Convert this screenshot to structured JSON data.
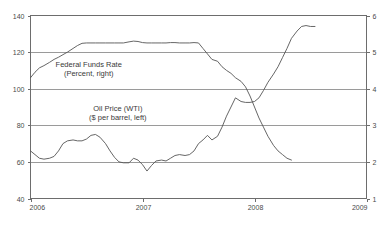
{
  "chart_data": {
    "type": "line",
    "title": "",
    "subtitle": "",
    "xlabel": "",
    "ylabel": "$ per barrel",
    "y2label": "Percent",
    "grid": true,
    "legend_position": "inline-annotation",
    "xlim": [
      2006.0,
      2009.0
    ],
    "xticks": [
      "2006",
      "2007",
      "2008",
      "2009"
    ],
    "xtick_values": [
      2006,
      2007,
      2008,
      2009
    ],
    "ylim": [
      40,
      140
    ],
    "yticks": [
      "40",
      "60",
      "80",
      "100",
      "120",
      "140"
    ],
    "ytick_values": [
      40,
      60,
      80,
      100,
      120,
      140
    ],
    "y2lim": [
      1,
      6
    ],
    "y2ticks": [
      "1",
      "2",
      "3",
      "4",
      "5",
      "6"
    ],
    "y2tick_values": [
      1,
      2,
      3,
      4,
      5,
      6
    ],
    "annotations": [
      {
        "id": "ffr-annotation",
        "line1": "Federal Funds Rate",
        "line2": "(Percent, right)",
        "x": 2006.52,
        "y_axis": "left",
        "y": 112
      },
      {
        "id": "oil-annotation",
        "line1": "Oil Price (WTI)",
        "line2": "($ per barrel, left)",
        "x": 2006.78,
        "y_axis": "left",
        "y": 88
      }
    ],
    "series": [
      {
        "name": "Oil Price (WTI)",
        "axis": "left",
        "units": "$ per barrel",
        "color": "#555555",
        "x": [
          2006.0,
          2006.04,
          2006.08,
          2006.12,
          2006.17,
          2006.21,
          2006.25,
          2006.29,
          2006.33,
          2006.38,
          2006.42,
          2006.46,
          2006.5,
          2006.54,
          2006.58,
          2006.62,
          2006.67,
          2006.71,
          2006.75,
          2006.79,
          2006.83,
          2006.88,
          2006.92,
          2006.96,
          2007.0,
          2007.04,
          2007.08,
          2007.12,
          2007.17,
          2007.21,
          2007.25,
          2007.29,
          2007.33,
          2007.38,
          2007.42,
          2007.46,
          2007.5,
          2007.54,
          2007.58,
          2007.62,
          2007.67,
          2007.71,
          2007.75,
          2007.79,
          2007.83,
          2007.88,
          2007.92,
          2007.96,
          2008.0,
          2008.04,
          2008.08,
          2008.12,
          2008.17,
          2008.21,
          2008.25,
          2008.29,
          2008.33,
          2008.38,
          2008.42,
          2008.46,
          2008.5,
          2008.54
        ],
        "y": [
          66,
          64,
          62,
          61.5,
          62,
          63,
          66,
          70,
          71.5,
          72,
          71.5,
          71.5,
          72.5,
          74.5,
          75,
          73.5,
          70,
          66,
          62.5,
          60,
          59.5,
          59.5,
          62,
          61,
          58.5,
          55,
          58,
          60.5,
          61,
          60.5,
          62,
          63.5,
          64,
          63.5,
          64,
          66,
          70,
          72,
          74.5,
          72,
          74,
          79,
          85,
          90,
          95,
          93,
          92.5,
          92.5,
          93,
          95,
          99,
          103.5,
          108,
          112,
          117,
          122,
          127.5,
          131.5,
          134,
          134.5,
          134,
          134
        ]
      },
      {
        "name": "Federal Funds Rate",
        "axis": "right",
        "units": "Percent",
        "color": "#555555",
        "x": [
          2006.0,
          2006.04,
          2006.08,
          2006.12,
          2006.17,
          2006.21,
          2006.25,
          2006.29,
          2006.33,
          2006.38,
          2006.42,
          2006.46,
          2006.5,
          2006.54,
          2006.58,
          2006.62,
          2006.67,
          2006.71,
          2006.75,
          2006.79,
          2006.83,
          2006.88,
          2006.92,
          2006.96,
          2007.0,
          2007.04,
          2007.08,
          2007.12,
          2007.17,
          2007.21,
          2007.25,
          2007.29,
          2007.33,
          2007.38,
          2007.42,
          2007.46,
          2007.5,
          2007.54,
          2007.58,
          2007.62,
          2007.67,
          2007.71,
          2007.75,
          2007.79,
          2007.83,
          2007.88,
          2007.92,
          2007.96,
          2008.0,
          2008.04,
          2008.08,
          2008.12,
          2008.17,
          2008.21,
          2008.25,
          2008.29,
          2008.33
        ],
        "y": [
          4.3,
          4.45,
          4.57,
          4.63,
          4.72,
          4.8,
          4.86,
          4.93,
          5.0,
          5.1,
          5.18,
          5.24,
          5.25,
          5.25,
          5.25,
          5.25,
          5.25,
          5.25,
          5.25,
          5.25,
          5.25,
          5.28,
          5.3,
          5.29,
          5.26,
          5.25,
          5.25,
          5.25,
          5.25,
          5.25,
          5.26,
          5.26,
          5.25,
          5.25,
          5.25,
          5.26,
          5.25,
          5.1,
          4.95,
          4.8,
          4.75,
          4.6,
          4.5,
          4.42,
          4.3,
          4.2,
          4.05,
          3.8,
          3.5,
          3.2,
          2.95,
          2.7,
          2.45,
          2.3,
          2.2,
          2.1,
          2.05
        ]
      }
    ]
  },
  "axes": {
    "left_axis_name": "oil-price-axis",
    "right_axis_name": "federal-funds-rate-axis",
    "bottom_axis_name": "year-axis"
  }
}
